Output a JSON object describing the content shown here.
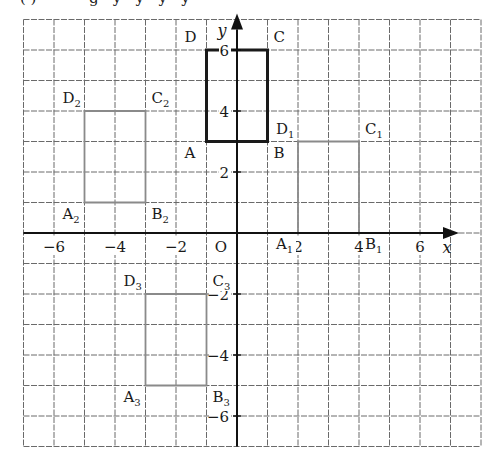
{
  "caption_fragment": "(·)  ·········  g  ·  y  ·  y  ·  y  ·  y",
  "chart_data": {
    "type": "coordinate-grid",
    "title": "",
    "xlabel": "x",
    "ylabel": "y",
    "origin_label": "O",
    "grid": true,
    "xlim": [
      -7,
      8
    ],
    "ylim": [
      -7,
      7
    ],
    "x_ticks": [
      -6,
      -4,
      -2,
      2,
      4,
      6
    ],
    "y_ticks": [
      6,
      4,
      2,
      -2,
      -4,
      -6
    ],
    "x_tick_labels": [
      "−6",
      "−4",
      "−2",
      "2",
      "4",
      "6"
    ],
    "y_tick_labels": [
      "6",
      "4",
      "2",
      "−2",
      "−4",
      "−6"
    ],
    "shapes": [
      {
        "name": "ABCD",
        "style": "bold",
        "vertices": [
          {
            "label": "A",
            "sub": "",
            "x": -1,
            "y": 3
          },
          {
            "label": "B",
            "sub": "",
            "x": 1,
            "y": 3
          },
          {
            "label": "C",
            "sub": "",
            "x": 1,
            "y": 6
          },
          {
            "label": "D",
            "sub": "",
            "x": -1,
            "y": 6
          }
        ]
      },
      {
        "name": "A1B1C1D1",
        "style": "thin",
        "vertices": [
          {
            "label": "A",
            "sub": "1",
            "x": 2,
            "y": 0
          },
          {
            "label": "B",
            "sub": "1",
            "x": 4,
            "y": 0
          },
          {
            "label": "C",
            "sub": "1",
            "x": 4,
            "y": 3
          },
          {
            "label": "D",
            "sub": "1",
            "x": 2,
            "y": 3
          }
        ]
      },
      {
        "name": "A2B2C2D2",
        "style": "thin",
        "vertices": [
          {
            "label": "A",
            "sub": "2",
            "x": -5,
            "y": 1
          },
          {
            "label": "B",
            "sub": "2",
            "x": -3,
            "y": 1
          },
          {
            "label": "C",
            "sub": "2",
            "x": -3,
            "y": 4
          },
          {
            "label": "D",
            "sub": "2",
            "x": -5,
            "y": 4
          }
        ]
      },
      {
        "name": "A3B3C3D3",
        "style": "thin",
        "vertices": [
          {
            "label": "A",
            "sub": "3",
            "x": -3,
            "y": -5
          },
          {
            "label": "B",
            "sub": "3",
            "x": -1,
            "y": -5
          },
          {
            "label": "C",
            "sub": "3",
            "x": -1,
            "y": -2
          },
          {
            "label": "D",
            "sub": "3",
            "x": -3,
            "y": -2
          }
        ]
      }
    ]
  },
  "colors": {
    "grid": "#6a6a6a",
    "axis": "#111111",
    "bold_rect": "#1a1a1a",
    "thin_rect": "#8a8a8a",
    "text": "#1a1a1a"
  }
}
